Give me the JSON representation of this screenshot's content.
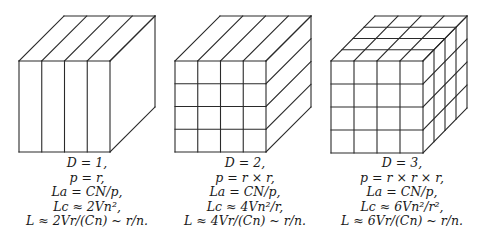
{
  "figure": {
    "panels": [
      {
        "id": "d1",
        "dimension": 1,
        "front": {
          "x": 19,
          "y": 61,
          "size": 91
        },
        "depth": {
          "dx": 45,
          "dy": -45
        },
        "divisions": {
          "front_cols": 4,
          "front_rows": 1,
          "top_cols": 4,
          "top_depth": 1,
          "side_depth": 1,
          "side_rows": 1
        },
        "caption_center_x": 87,
        "caption": [
          "D = 1,",
          "p = r,",
          "La = CN/p,",
          "Lc ≈ 2Vn²,",
          "L ≈ 2Vr/(Cn) ~ r/n."
        ]
      },
      {
        "id": "d2",
        "dimension": 2,
        "front": {
          "x": 175,
          "y": 61,
          "size": 91
        },
        "depth": {
          "dx": 45,
          "dy": -45
        },
        "divisions": {
          "front_cols": 4,
          "front_rows": 4,
          "top_cols": 4,
          "top_depth": 1,
          "side_depth": 1,
          "side_rows": 4
        },
        "caption_center_x": 245,
        "caption": [
          "D = 2,",
          "p = r × r,",
          "La = CN/p,",
          "Lc ≈ 4Vn²/r,",
          "L ≈ 4Vr/(Cn) ~ r/n."
        ]
      },
      {
        "id": "d3",
        "dimension": 3,
        "front": {
          "x": 331,
          "y": 61,
          "size": 92
        },
        "depth": {
          "dx": 44,
          "dy": -45
        },
        "divisions": {
          "front_cols": 4,
          "front_rows": 4,
          "top_cols": 4,
          "top_depth": 4,
          "side_depth": 4,
          "side_rows": 4
        },
        "caption_center_x": 402,
        "caption": [
          "D = 3,",
          "p = r × r × r,",
          "La = CN/p,",
          "Lc ≈ 6Vn²/r²,",
          "L ≈ 6Vr/(Cn) ~ r/n."
        ]
      }
    ],
    "colors": {
      "stroke": "#2a2a2a",
      "background": "#ffffff",
      "text": "#1a1a1a"
    }
  }
}
